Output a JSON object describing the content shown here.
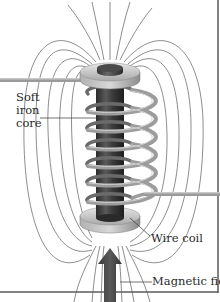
{
  "diagram": {
    "labels": {
      "core_line1": "Soft",
      "core_line2": "iron",
      "core_line3": "core",
      "coil": "Wire coil",
      "field": "Magnetic field"
    },
    "components": [
      "soft-iron-core",
      "wire-coil",
      "top-disc",
      "bottom-disc",
      "magnetic-field-lines",
      "magnetic-field-arrow",
      "lead-wires"
    ],
    "colors": {
      "background": "#ffffff",
      "field_lines": "#6a6a6a",
      "core": "#3c3c3c",
      "coil": "#8a8a8a",
      "disc": "#c8c8c8",
      "arrow": "#4a4a4a",
      "border": "#555555",
      "text": "#2a2a2a"
    }
  }
}
